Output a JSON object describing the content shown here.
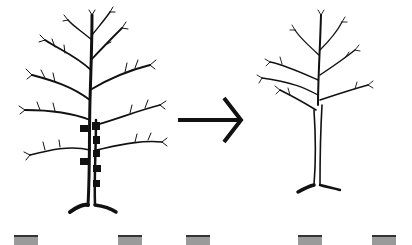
{
  "diagram": {
    "panels": [
      {
        "id": "before",
        "label": "",
        "marks": 7
      },
      {
        "id": "after",
        "label": ""
      }
    ],
    "arrow": {
      "direction": "right",
      "color": "#111111"
    },
    "colors": {
      "ink": "#111111",
      "background": "#ffffff",
      "strip": "#9a9a9a"
    },
    "bottom_strip": {
      "tabs": 6
    }
  }
}
